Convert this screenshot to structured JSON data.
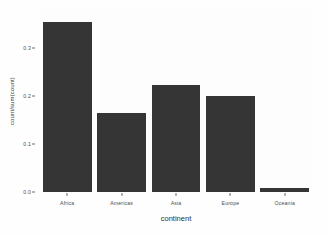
{
  "chart_data": {
    "type": "bar",
    "title": "",
    "subtitle": "",
    "xlabel": "continent",
    "ylabel": "count/sum(count)",
    "categories": [
      "Africa",
      "Americas",
      "Asia",
      "Europe",
      "Oceania"
    ],
    "values": [
      0.354,
      0.165,
      0.223,
      0.2,
      0.008
    ],
    "series": [
      {
        "name": "proportion",
        "values": [
          0.354,
          0.165,
          0.223,
          0.2,
          0.008
        ]
      }
    ],
    "ylim": [
      0,
      0.379
    ],
    "xlim": [
      0,
      5
    ],
    "y_ticks": [
      0.0,
      0.1,
      0.2,
      0.3
    ],
    "y_ticklabels": [
      "0.0",
      "0.1",
      "0.2",
      "0.3"
    ],
    "x_ticklabels": [
      "Africa",
      "Americas",
      "Asia",
      "Europe",
      "Oceania"
    ],
    "grid": false,
    "legend": false,
    "legend_position": "none",
    "bar_color": "#353535",
    "panel_background": "#fdfdfd",
    "axis_text_color": "#4d4d4d",
    "axis_title_color": "#2e2e2e",
    "annotations": []
  }
}
